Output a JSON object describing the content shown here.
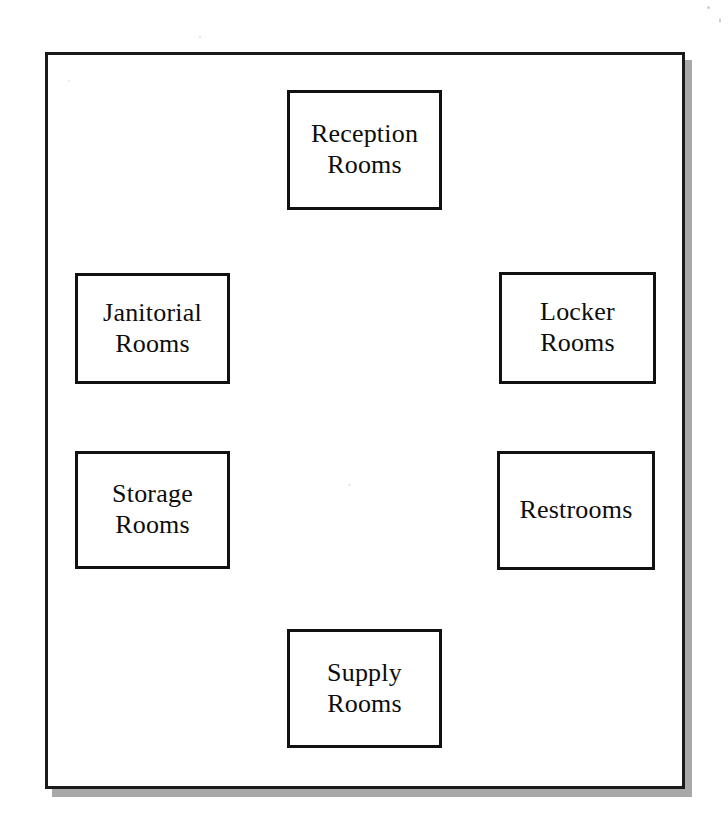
{
  "diagram": {
    "type": "ring-layout-block-diagram",
    "background_color": "#ffffff",
    "frame": {
      "border_color": "#1a1a1a",
      "shadow_color": "#a9a9a9",
      "fill_color": "#ffffff"
    },
    "box_style": {
      "border_color": "#111111",
      "fill_color": "#ffffff",
      "text_color": "#0d0d0d"
    },
    "rooms": [
      {
        "id": "reception",
        "label": "Reception\nRooms",
        "position": "top-center"
      },
      {
        "id": "janitorial",
        "label": "Janitorial\nRooms",
        "position": "left-upper"
      },
      {
        "id": "locker",
        "label": "Locker\nRooms",
        "position": "right-upper"
      },
      {
        "id": "storage",
        "label": "Storage\nRooms",
        "position": "left-lower"
      },
      {
        "id": "restrooms",
        "label": "Restrooms",
        "position": "right-lower"
      },
      {
        "id": "supply",
        "label": "Supply\nRooms",
        "position": "bottom-center"
      }
    ]
  }
}
